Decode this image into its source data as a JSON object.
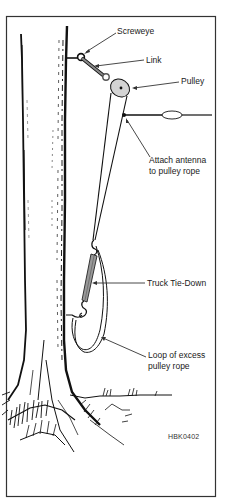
{
  "figure": {
    "code": "HBK0402",
    "colors": {
      "ink": "#111111",
      "frame": "#333333",
      "link_fill": "#888888",
      "pulley_fill": "#d4d4d4",
      "tiedown_fill": "#999999",
      "background": "#ffffff"
    }
  },
  "labels": {
    "screweye": "Screweye",
    "link": "Link",
    "pulley": "Pulley",
    "attach_line1": "Attach antenna",
    "attach_line2": "to pulley rope",
    "tiedown": "Truck Tie-Down",
    "loop_line1": "Loop of excess",
    "loop_line2": "pulley rope"
  }
}
